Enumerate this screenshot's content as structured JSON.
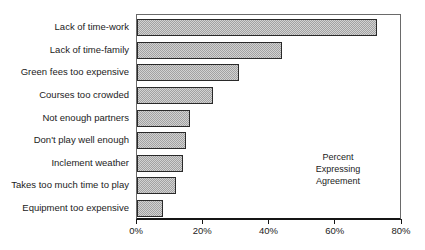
{
  "chart_data": {
    "type": "bar",
    "orientation": "horizontal",
    "title": "",
    "categories": [
      "Lack of time-work",
      "Lack of time-family",
      "Green fees too expensive",
      "Courses too crowded",
      "Not enough partners",
      "Don't play well enough",
      "Inclement weather",
      "Takes too much time to play",
      "Equipment too expensive"
    ],
    "values": [
      73,
      44,
      31,
      23,
      16,
      15,
      14,
      12,
      8
    ],
    "unit": "%",
    "xlabel": "",
    "ylabel": "",
    "xlim": [
      0,
      80
    ],
    "x_tick_labels": [
      "0%",
      "20%",
      "40%",
      "60%",
      "80%"
    ],
    "x_tick_values": [
      0,
      20,
      40,
      60,
      80
    ],
    "annotation_lines": [
      "Percent",
      "Expressing",
      "Agreement"
    ],
    "grid": false,
    "legend_position": "none",
    "colors": {
      "background": "#ffffff",
      "text": "#1b1b1b",
      "frame": "#6a6a6a",
      "axis": "#151515",
      "bar_fill_light": "#d2d2d2",
      "bar_fill_dark": "#a2a2a2",
      "bar_border": "#2a2a2a"
    }
  }
}
